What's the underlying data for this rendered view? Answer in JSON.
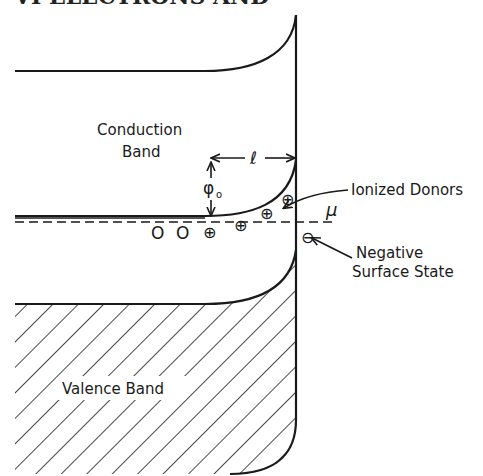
{
  "page_header": {
    "text": "VI   ELECTRONS AND"
  },
  "diagram": {
    "labels": {
      "conduction_band_line1": "Conduction",
      "conduction_band_line2": "Band",
      "valence_band": "Valence Band",
      "ionized_donors": "Ionized Donors",
      "negative_surface_line1": "Negative",
      "surface_state_line2": "Surface State",
      "fermi_level": "μ",
      "depletion_length": "ℓ",
      "barrier_height": "φ",
      "barrier_subscript": "o"
    },
    "symbols": {
      "neutral_donor": "O",
      "ionized_donor": "⊕",
      "negative_surface_state": "⊖"
    },
    "colors": {
      "ink": "#1a1a1a",
      "background": "#ffffff"
    }
  }
}
